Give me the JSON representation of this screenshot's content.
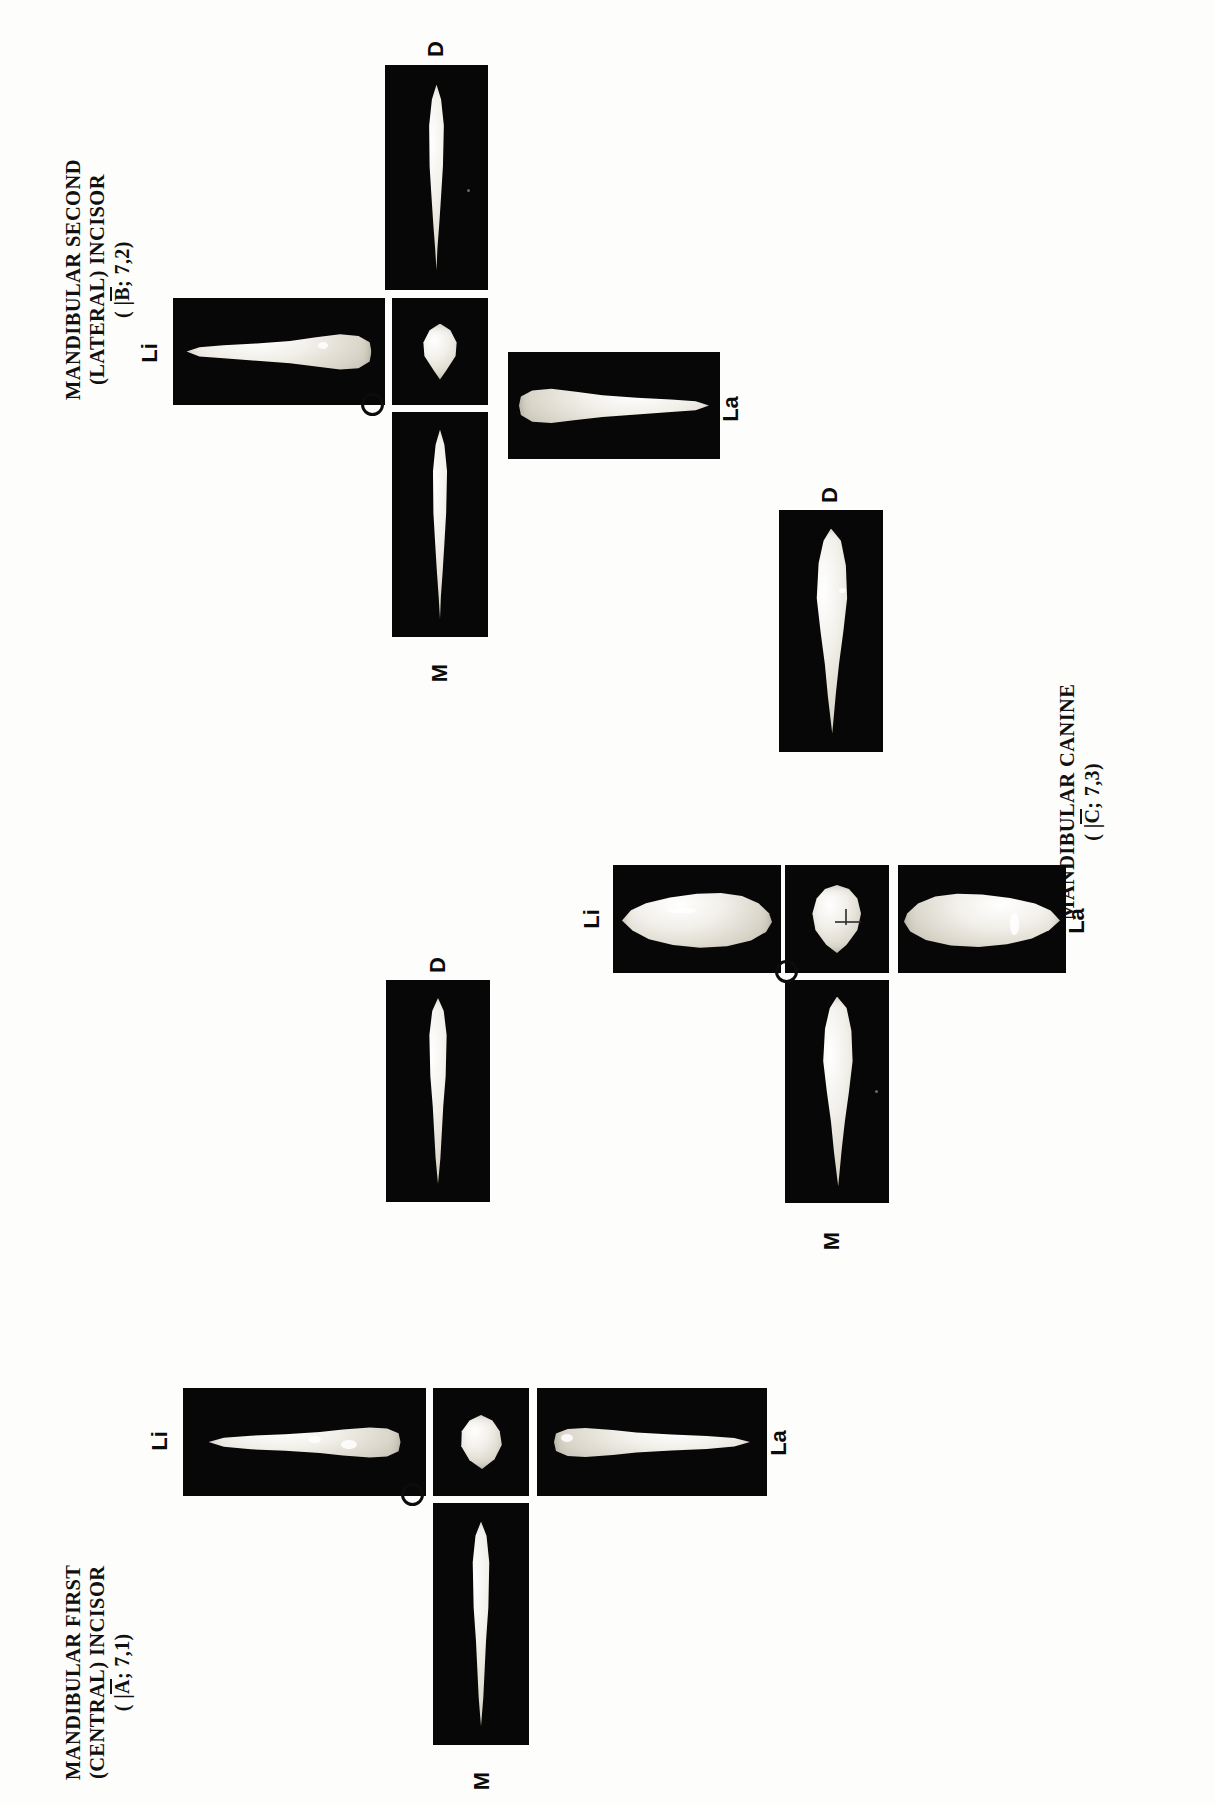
{
  "plate": {
    "title": "Mandibular anterior teeth photographic plate",
    "background_color": "#fdfdfb",
    "panel_color": "#070707",
    "specimen_color": "#efece3",
    "orientation": "captions and labels rotated 90 degrees counter-clockwise"
  },
  "view_labels": {
    "distal": "D",
    "lingual": "Li",
    "incisal": "O",
    "labial": "La",
    "mesial": "M"
  },
  "groups": [
    {
      "id": "mandibular-second-lateral-incisor",
      "caption_lines": [
        "MANDIBULAR SECOND",
        "(LATERAL) INCISOR"
      ],
      "designation_prefix": "( |",
      "designation_letter": "B",
      "designation_suffix": "; 7,2)",
      "designation_full": "( |B̄; 7,2)",
      "views": [
        {
          "name": "distal",
          "label": "D",
          "position": "top"
        },
        {
          "name": "lingual",
          "label": "Li",
          "position": "left"
        },
        {
          "name": "incisal",
          "label": "O",
          "position": "center"
        },
        {
          "name": "labial",
          "label": "La",
          "position": "right"
        },
        {
          "name": "mesial",
          "label": "M",
          "position": "bottom"
        }
      ]
    },
    {
      "id": "mandibular-canine",
      "caption_lines": [
        "MANDIBULAR CANINE"
      ],
      "designation_prefix": "( |",
      "designation_letter": "C",
      "designation_suffix": "; 7,3)",
      "designation_full": "( |C̄; 7,3)",
      "views": [
        {
          "name": "distal",
          "label": "D",
          "position": "top"
        },
        {
          "name": "lingual",
          "label": "Li",
          "position": "left"
        },
        {
          "name": "incisal",
          "label": "O",
          "position": "center"
        },
        {
          "name": "labial",
          "label": "La",
          "position": "right"
        },
        {
          "name": "mesial",
          "label": "M",
          "position": "bottom"
        }
      ]
    },
    {
      "id": "mandibular-first-central-incisor",
      "caption_lines": [
        "MANDIBULAR FIRST",
        "(CENTRAL) INCISOR"
      ],
      "designation_prefix": "( |",
      "designation_letter": "A",
      "designation_suffix": "; 7,1)",
      "designation_full": "( |Ā; 7,1)",
      "views": [
        {
          "name": "distal",
          "label": "D",
          "position": "top"
        },
        {
          "name": "lingual",
          "label": "Li",
          "position": "left"
        },
        {
          "name": "incisal",
          "label": "O",
          "position": "center"
        },
        {
          "name": "labial",
          "label": "La",
          "position": "right"
        },
        {
          "name": "mesial",
          "label": "M",
          "position": "bottom"
        }
      ]
    }
  ]
}
